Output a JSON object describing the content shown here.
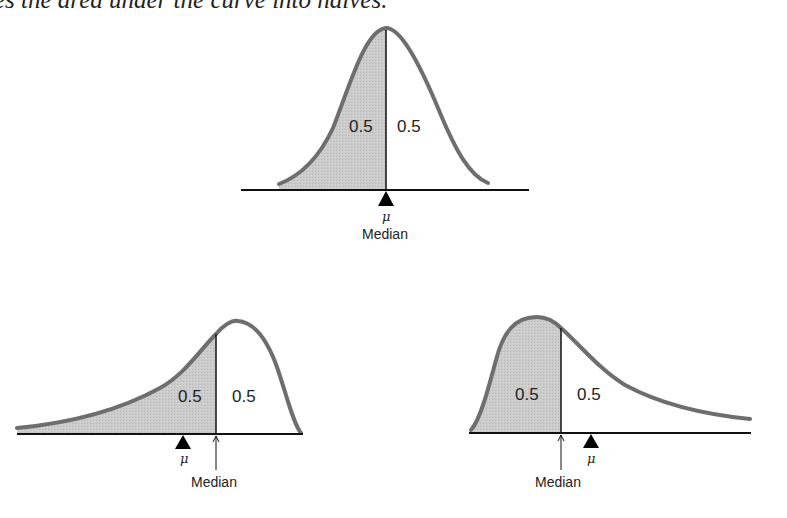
{
  "caption": "es the area under the curve into halves.",
  "diagrams": [
    {
      "name": "symmetric",
      "left_area": "0.5",
      "right_area": "0.5",
      "mean_symbol": "μ",
      "median_label": "Median"
    },
    {
      "name": "left-skewed",
      "left_area": "0.5",
      "right_area": "0.5",
      "mean_symbol": "μ",
      "median_label": "Median"
    },
    {
      "name": "right-skewed",
      "left_area": "0.5",
      "right_area": "0.5",
      "mean_symbol": "μ",
      "median_label": "Median"
    }
  ],
  "colors": {
    "shade": "#c8c8c8",
    "curve": "#6e6e6e",
    "axis": "#111111"
  }
}
